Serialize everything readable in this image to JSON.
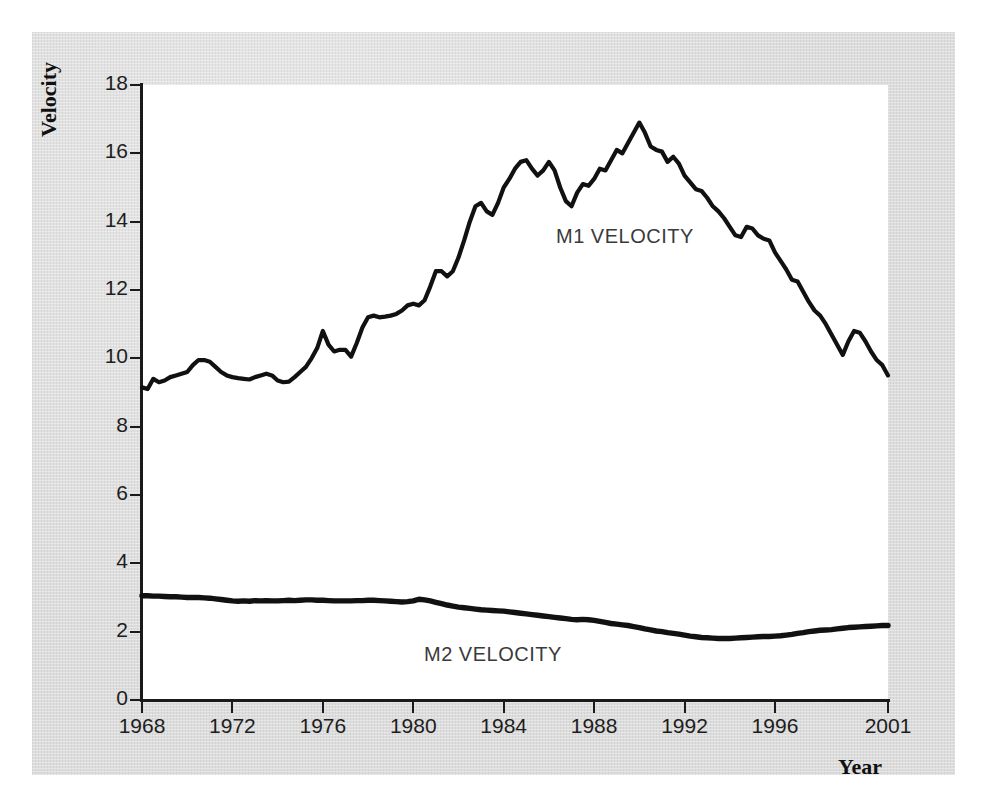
{
  "figure": {
    "background_color": "#dcdcdc",
    "plot_background_color": "#ffffff",
    "line_color": "#111111"
  },
  "axes": {
    "y_title": "Velocity",
    "x_title": "Year",
    "y_ticks": [
      "0",
      "2",
      "4",
      "6",
      "8",
      "10",
      "12",
      "14",
      "16",
      "18"
    ],
    "x_ticks": [
      "1968",
      "1972",
      "1976",
      "1980",
      "1984",
      "1988",
      "1992",
      "1996",
      "2001"
    ]
  },
  "annotations": {
    "m1": "M1 VELOCITY",
    "m2": "M2 VELOCITY"
  },
  "chart_data": {
    "type": "line",
    "title": "",
    "xlabel": "Year",
    "ylabel": "Velocity",
    "xlim": [
      1968,
      2001
    ],
    "ylim": [
      0,
      18
    ],
    "ytick_values": [
      0,
      2,
      4,
      6,
      8,
      10,
      12,
      14,
      16,
      18
    ],
    "xtick_values": [
      1968,
      1972,
      1976,
      1980,
      1984,
      1988,
      1992,
      1996,
      2001
    ],
    "grid": false,
    "legend": "inline annotations on curves",
    "x": [
      1968.0,
      1968.25,
      1968.5,
      1968.75,
      1969.0,
      1969.25,
      1969.5,
      1969.75,
      1970.0,
      1970.25,
      1970.5,
      1970.75,
      1971.0,
      1971.25,
      1971.5,
      1971.75,
      1972.0,
      1972.25,
      1972.5,
      1972.75,
      1973.0,
      1973.25,
      1973.5,
      1973.75,
      1974.0,
      1974.25,
      1974.5,
      1974.75,
      1975.0,
      1975.25,
      1975.5,
      1975.75,
      1976.0,
      1976.25,
      1976.5,
      1976.75,
      1977.0,
      1977.25,
      1977.5,
      1977.75,
      1978.0,
      1978.25,
      1978.5,
      1978.75,
      1979.0,
      1979.25,
      1979.5,
      1979.75,
      1980.0,
      1980.25,
      1980.5,
      1980.75,
      1981.0,
      1981.25,
      1981.5,
      1981.75,
      1982.0,
      1982.25,
      1982.5,
      1982.75,
      1983.0,
      1983.25,
      1983.5,
      1983.75,
      1984.0,
      1984.25,
      1984.5,
      1984.75,
      1985.0,
      1985.25,
      1985.5,
      1985.75,
      1986.0,
      1986.25,
      1986.5,
      1986.75,
      1987.0,
      1987.25,
      1987.5,
      1987.75,
      1988.0,
      1988.25,
      1988.5,
      1988.75,
      1989.0,
      1989.25,
      1989.5,
      1989.75,
      1990.0,
      1990.25,
      1990.5,
      1990.75,
      1991.0,
      1991.25,
      1991.5,
      1991.75,
      1992.0,
      1992.25,
      1992.5,
      1992.75,
      1993.0,
      1993.25,
      1993.5,
      1993.75,
      1994.0,
      1994.25,
      1994.5,
      1994.75,
      1995.0,
      1995.25,
      1995.5,
      1995.75,
      1996.0,
      1996.25,
      1996.5,
      1996.75,
      1997.0,
      1997.25,
      1997.5,
      1997.75,
      1998.0,
      1998.25,
      1998.5,
      1998.75,
      1999.0,
      1999.25,
      1999.5,
      1999.75,
      2000.0,
      2000.25,
      2000.5,
      2000.75,
      2001.0
    ],
    "series": [
      {
        "name": "M1 VELOCITY",
        "label_text": "M1 VELOCITY",
        "values": [
          9.15,
          9.1,
          9.4,
          9.3,
          9.35,
          9.45,
          9.5,
          9.55,
          9.6,
          9.8,
          9.95,
          9.95,
          9.9,
          9.75,
          9.6,
          9.5,
          9.45,
          9.42,
          9.4,
          9.38,
          9.45,
          9.5,
          9.55,
          9.5,
          9.35,
          9.3,
          9.32,
          9.45,
          9.6,
          9.75,
          10.0,
          10.3,
          10.8,
          10.4,
          10.2,
          10.25,
          10.25,
          10.05,
          10.45,
          10.9,
          11.2,
          11.25,
          11.2,
          11.22,
          11.25,
          11.3,
          11.4,
          11.55,
          11.6,
          11.55,
          11.7,
          12.1,
          12.55,
          12.55,
          12.4,
          12.55,
          12.95,
          13.45,
          14.0,
          14.45,
          14.55,
          14.3,
          14.2,
          14.55,
          15.0,
          15.25,
          15.55,
          15.75,
          15.8,
          15.55,
          15.35,
          15.5,
          15.75,
          15.5,
          15.0,
          14.6,
          14.45,
          14.85,
          15.1,
          15.05,
          15.25,
          15.55,
          15.5,
          15.8,
          16.1,
          16.0,
          16.3,
          16.6,
          16.9,
          16.6,
          16.2,
          16.1,
          16.05,
          15.75,
          15.9,
          15.7,
          15.35,
          15.15,
          14.95,
          14.9,
          14.7,
          14.45,
          14.3,
          14.1,
          13.85,
          13.6,
          13.55,
          13.85,
          13.8,
          13.6,
          13.5,
          13.45,
          13.1,
          12.85,
          12.6,
          12.3,
          12.25,
          11.95,
          11.65,
          11.4,
          11.25,
          11.0,
          10.7,
          10.4,
          10.1,
          10.5,
          10.8,
          10.75,
          10.5,
          10.2,
          9.95,
          9.8,
          9.5
        ]
      },
      {
        "name": "M2 VELOCITY",
        "label_text": "M2 VELOCITY",
        "values": [
          3.05,
          3.05,
          3.04,
          3.04,
          3.03,
          3.02,
          3.02,
          3.01,
          3.0,
          3.0,
          3.0,
          2.99,
          2.98,
          2.96,
          2.94,
          2.92,
          2.9,
          2.89,
          2.9,
          2.89,
          2.91,
          2.9,
          2.91,
          2.9,
          2.9,
          2.91,
          2.92,
          2.91,
          2.92,
          2.93,
          2.93,
          2.92,
          2.92,
          2.91,
          2.9,
          2.9,
          2.9,
          2.9,
          2.91,
          2.91,
          2.92,
          2.92,
          2.91,
          2.9,
          2.89,
          2.88,
          2.87,
          2.88,
          2.9,
          2.95,
          2.93,
          2.9,
          2.86,
          2.82,
          2.78,
          2.75,
          2.72,
          2.7,
          2.68,
          2.66,
          2.64,
          2.63,
          2.62,
          2.61,
          2.6,
          2.58,
          2.56,
          2.54,
          2.52,
          2.5,
          2.48,
          2.46,
          2.44,
          2.42,
          2.4,
          2.38,
          2.36,
          2.35,
          2.36,
          2.35,
          2.33,
          2.3,
          2.27,
          2.24,
          2.22,
          2.2,
          2.18,
          2.15,
          2.12,
          2.08,
          2.05,
          2.02,
          2.0,
          1.97,
          1.95,
          1.93,
          1.9,
          1.87,
          1.85,
          1.83,
          1.82,
          1.81,
          1.8,
          1.8,
          1.8,
          1.81,
          1.82,
          1.83,
          1.84,
          1.85,
          1.86,
          1.86,
          1.87,
          1.88,
          1.9,
          1.92,
          1.95,
          1.97,
          2.0,
          2.02,
          2.04,
          2.05,
          2.06,
          2.08,
          2.1,
          2.12,
          2.13,
          2.14,
          2.15,
          2.16,
          2.17,
          2.18,
          2.18
        ]
      }
    ]
  }
}
